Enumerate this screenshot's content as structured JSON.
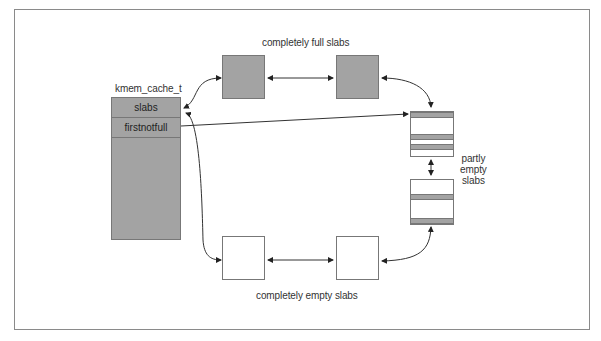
{
  "diagram": {
    "cache": {
      "title": "kmem_cache_t",
      "fields": [
        "slabs",
        "firstnotfull"
      ]
    },
    "groups": {
      "full": {
        "label": "completely full slabs",
        "count": 2
      },
      "partial": {
        "label_lines": [
          "partly",
          "empty",
          "slabs"
        ],
        "count": 2
      },
      "empty": {
        "label": "completely empty slabs",
        "count": 2
      }
    },
    "colors": {
      "fill_gray": "#a3a3a3",
      "stroke": "#777777",
      "frame": "#8a8a8a",
      "text": "#333333"
    }
  }
}
